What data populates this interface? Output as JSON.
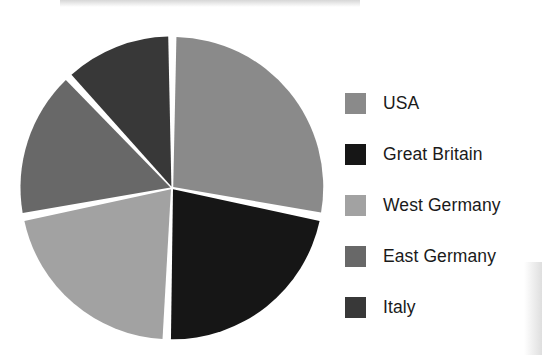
{
  "chart_data": {
    "type": "pie",
    "title": "",
    "subtitle": "",
    "xlabel": "",
    "ylabel": "",
    "grid": false,
    "legend_position": "right",
    "start_angle_deg": 0,
    "direction": "clockwise",
    "exploded": false,
    "slice_gap": true,
    "categories": [
      "USA",
      "Great Britain",
      "West Germany",
      "East Germany",
      "Italy"
    ],
    "values": [
      28,
      22.5,
      21.5,
      16,
      12
    ],
    "units": "percent",
    "slices": [
      {
        "label": "USA",
        "value": 28,
        "color": "#8a8a8a",
        "start_angle_deg": 0,
        "end_angle_deg": 101
      },
      {
        "label": "Great Britain",
        "value": 22.5,
        "color": "#161616",
        "start_angle_deg": 101,
        "end_angle_deg": 182
      },
      {
        "label": "West Germany",
        "value": 21.5,
        "color": "#a2a2a2",
        "start_angle_deg": 182,
        "end_angle_deg": 259
      },
      {
        "label": "East Germany",
        "value": 16,
        "color": "#686868",
        "start_angle_deg": 259,
        "end_angle_deg": 317
      },
      {
        "label": "Italy",
        "value": 12,
        "color": "#383838",
        "start_angle_deg": 317,
        "end_angle_deg": 360
      }
    ]
  },
  "legend": {
    "items": [
      {
        "label": "USA",
        "color": "#8a8a8a"
      },
      {
        "label": "Great Britain",
        "color": "#161616"
      },
      {
        "label": "West Germany",
        "color": "#a2a2a2"
      },
      {
        "label": "East Germany",
        "color": "#686868"
      },
      {
        "label": "Italy",
        "color": "#383838"
      }
    ]
  },
  "canvas": {
    "background": "#ffffff",
    "center_x": 172,
    "center_y": 188,
    "radius": 150
  }
}
